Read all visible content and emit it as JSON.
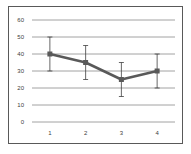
{
  "chart_data": {
    "type": "line",
    "title": "",
    "xlabel": "",
    "ylabel": "",
    "categories": [
      "1",
      "2",
      "3",
      "4"
    ],
    "series": [
      {
        "name": "Series 1",
        "values": [
          40,
          35,
          25,
          30
        ],
        "error_low": [
          30,
          25,
          15,
          20
        ],
        "error_high": [
          50,
          45,
          35,
          40
        ],
        "color": "#595959"
      }
    ],
    "ylim": [
      0,
      60
    ],
    "yticks": [
      "0",
      "10",
      "20",
      "30",
      "40",
      "50",
      "60"
    ],
    "grid": true,
    "legend": "none"
  }
}
